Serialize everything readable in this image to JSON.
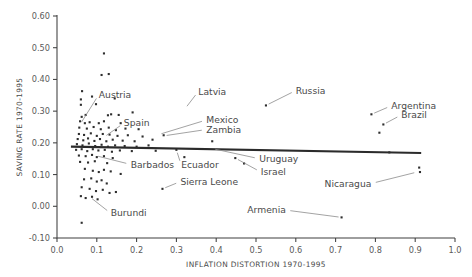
{
  "chart_data": {
    "type": "scatter",
    "title": "",
    "subtitle": "",
    "xlabel": "INFLATION DISTORTION 1970-1995",
    "ylabel": "SAVING RATE 1970-1995",
    "xlim": [
      0.0,
      1.0
    ],
    "ylim": [
      -0.1,
      0.6
    ],
    "grid": false,
    "legend": null,
    "xticks": [
      "0.0",
      "0.1",
      "0.2",
      "0.3",
      "0.4",
      "0.5",
      "0.6",
      "0.7",
      "0.8",
      "0.9",
      "1.0"
    ],
    "xtick_values": [
      0.0,
      0.1,
      0.2,
      0.3,
      0.4,
      0.5,
      0.6,
      0.7,
      0.8,
      0.9,
      1.0
    ],
    "yticks": [
      "-0.10",
      "0.00",
      "0.10",
      "0.20",
      "0.30",
      "0.40",
      "0.50",
      "0.60"
    ],
    "ytick_values": [
      -0.1,
      0.0,
      0.1,
      0.2,
      0.3,
      0.4,
      0.5,
      0.6
    ],
    "trend_line": {
      "x_start": 0.035,
      "y_start": 0.188,
      "x_end": 0.915,
      "y_end": 0.168
    },
    "points": [
      {
        "x": 0.118,
        "y": 0.482
      },
      {
        "x": 0.112,
        "y": 0.414
      },
      {
        "x": 0.13,
        "y": 0.417
      },
      {
        "x": 0.063,
        "y": 0.363
      },
      {
        "x": 0.088,
        "y": 0.346
      },
      {
        "x": 0.06,
        "y": 0.337
      },
      {
        "x": 0.145,
        "y": 0.34
      },
      {
        "x": 0.06,
        "y": 0.32
      },
      {
        "x": 0.098,
        "y": 0.322
      },
      {
        "x": 0.525,
        "y": 0.318
      },
      {
        "x": 0.79,
        "y": 0.29
      },
      {
        "x": 0.19,
        "y": 0.296
      },
      {
        "x": 0.062,
        "y": 0.282
      },
      {
        "x": 0.072,
        "y": 0.288
      },
      {
        "x": 0.128,
        "y": 0.287
      },
      {
        "x": 0.136,
        "y": 0.29
      },
      {
        "x": 0.155,
        "y": 0.288
      },
      {
        "x": 0.058,
        "y": 0.268
      },
      {
        "x": 0.07,
        "y": 0.262
      },
      {
        "x": 0.082,
        "y": 0.265
      },
      {
        "x": 0.105,
        "y": 0.262
      },
      {
        "x": 0.118,
        "y": 0.268
      },
      {
        "x": 0.16,
        "y": 0.262
      },
      {
        "x": 0.82,
        "y": 0.258
      },
      {
        "x": 0.056,
        "y": 0.248
      },
      {
        "x": 0.075,
        "y": 0.245
      },
      {
        "x": 0.092,
        "y": 0.25
      },
      {
        "x": 0.11,
        "y": 0.243
      },
      {
        "x": 0.13,
        "y": 0.248
      },
      {
        "x": 0.148,
        "y": 0.24
      },
      {
        "x": 0.172,
        "y": 0.245
      },
      {
        "x": 0.205,
        "y": 0.243
      },
      {
        "x": 0.81,
        "y": 0.232
      },
      {
        "x": 0.055,
        "y": 0.228
      },
      {
        "x": 0.068,
        "y": 0.225
      },
      {
        "x": 0.085,
        "y": 0.23
      },
      {
        "x": 0.1,
        "y": 0.222
      },
      {
        "x": 0.115,
        "y": 0.228
      },
      {
        "x": 0.132,
        "y": 0.226
      },
      {
        "x": 0.152,
        "y": 0.222
      },
      {
        "x": 0.178,
        "y": 0.224
      },
      {
        "x": 0.215,
        "y": 0.22
      },
      {
        "x": 0.268,
        "y": 0.224
      },
      {
        "x": 0.052,
        "y": 0.212
      },
      {
        "x": 0.066,
        "y": 0.208
      },
      {
        "x": 0.078,
        "y": 0.214
      },
      {
        "x": 0.094,
        "y": 0.206
      },
      {
        "x": 0.108,
        "y": 0.212
      },
      {
        "x": 0.124,
        "y": 0.205
      },
      {
        "x": 0.14,
        "y": 0.21
      },
      {
        "x": 0.165,
        "y": 0.207
      },
      {
        "x": 0.195,
        "y": 0.205
      },
      {
        "x": 0.24,
        "y": 0.21
      },
      {
        "x": 0.39,
        "y": 0.205
      },
      {
        "x": 0.05,
        "y": 0.196
      },
      {
        "x": 0.064,
        "y": 0.192
      },
      {
        "x": 0.08,
        "y": 0.198
      },
      {
        "x": 0.096,
        "y": 0.19
      },
      {
        "x": 0.112,
        "y": 0.194
      },
      {
        "x": 0.128,
        "y": 0.188
      },
      {
        "x": 0.146,
        "y": 0.192
      },
      {
        "x": 0.17,
        "y": 0.19
      },
      {
        "x": 0.2,
        "y": 0.188
      },
      {
        "x": 0.23,
        "y": 0.192
      },
      {
        "x": 0.048,
        "y": 0.178
      },
      {
        "x": 0.062,
        "y": 0.18
      },
      {
        "x": 0.076,
        "y": 0.174
      },
      {
        "x": 0.09,
        "y": 0.18
      },
      {
        "x": 0.104,
        "y": 0.176
      },
      {
        "x": 0.12,
        "y": 0.178
      },
      {
        "x": 0.138,
        "y": 0.172
      },
      {
        "x": 0.158,
        "y": 0.176
      },
      {
        "x": 0.188,
        "y": 0.174
      },
      {
        "x": 0.248,
        "y": 0.175
      },
      {
        "x": 0.3,
        "y": 0.178
      },
      {
        "x": 0.835,
        "y": 0.17
      },
      {
        "x": 0.055,
        "y": 0.16
      },
      {
        "x": 0.072,
        "y": 0.158
      },
      {
        "x": 0.088,
        "y": 0.162
      },
      {
        "x": 0.1,
        "y": 0.155
      },
      {
        "x": 0.118,
        "y": 0.158
      },
      {
        "x": 0.14,
        "y": 0.152
      },
      {
        "x": 0.32,
        "y": 0.155
      },
      {
        "x": 0.448,
        "y": 0.152
      },
      {
        "x": 0.058,
        "y": 0.14
      },
      {
        "x": 0.078,
        "y": 0.138
      },
      {
        "x": 0.095,
        "y": 0.142
      },
      {
        "x": 0.126,
        "y": 0.136
      },
      {
        "x": 0.47,
        "y": 0.135
      },
      {
        "x": 0.07,
        "y": 0.118
      },
      {
        "x": 0.09,
        "y": 0.112
      },
      {
        "x": 0.105,
        "y": 0.108
      },
      {
        "x": 0.118,
        "y": 0.115
      },
      {
        "x": 0.135,
        "y": 0.11
      },
      {
        "x": 0.16,
        "y": 0.102
      },
      {
        "x": 0.91,
        "y": 0.122
      },
      {
        "x": 0.912,
        "y": 0.108
      },
      {
        "x": 0.068,
        "y": 0.085
      },
      {
        "x": 0.086,
        "y": 0.088
      },
      {
        "x": 0.1,
        "y": 0.078
      },
      {
        "x": 0.112,
        "y": 0.082
      },
      {
        "x": 0.125,
        "y": 0.072
      },
      {
        "x": 0.062,
        "y": 0.06
      },
      {
        "x": 0.082,
        "y": 0.055
      },
      {
        "x": 0.098,
        "y": 0.048
      },
      {
        "x": 0.115,
        "y": 0.052
      },
      {
        "x": 0.132,
        "y": 0.042
      },
      {
        "x": 0.148,
        "y": 0.045
      },
      {
        "x": 0.265,
        "y": 0.055
      },
      {
        "x": 0.06,
        "y": 0.032
      },
      {
        "x": 0.072,
        "y": 0.026
      },
      {
        "x": 0.088,
        "y": 0.03
      },
      {
        "x": 0.102,
        "y": 0.022
      },
      {
        "x": 0.062,
        "y": -0.052
      },
      {
        "x": 0.715,
        "y": -0.035
      }
    ],
    "annotations": [
      {
        "label": "Austria",
        "label_x": 0.105,
        "label_y": 0.352,
        "point_x": 0.058,
        "point_y": 0.258
      },
      {
        "label": "Latvia",
        "label_x": 0.355,
        "label_y": 0.362,
        "point_x": 0.322,
        "point_y": 0.308
      },
      {
        "label": "Russia",
        "label_x": 0.6,
        "label_y": 0.365,
        "point_x": 0.525,
        "point_y": 0.318
      },
      {
        "label": "Argentina",
        "label_x": 0.84,
        "label_y": 0.317,
        "point_x": 0.79,
        "point_y": 0.29
      },
      {
        "label": "Brazil",
        "label_x": 0.865,
        "label_y": 0.288,
        "point_x": 0.82,
        "point_y": 0.258
      },
      {
        "label": "Spain",
        "label_x": 0.168,
        "label_y": 0.262,
        "point_x": 0.118,
        "point_y": 0.218
      },
      {
        "label": "Mexico",
        "label_x": 0.375,
        "label_y": 0.272,
        "point_x": 0.255,
        "point_y": 0.226
      },
      {
        "label": "Zambia",
        "label_x": 0.375,
        "label_y": 0.242,
        "point_x": 0.268,
        "point_y": 0.222
      },
      {
        "label": "Uruguay",
        "label_x": 0.508,
        "label_y": 0.15,
        "point_x": 0.39,
        "point_y": 0.182
      },
      {
        "label": "Barbados",
        "label_x": 0.185,
        "label_y": 0.132,
        "point_x": 0.096,
        "point_y": 0.16
      },
      {
        "label": "Ecuador",
        "label_x": 0.312,
        "label_y": 0.13,
        "point_x": 0.3,
        "point_y": 0.178
      },
      {
        "label": "Israel",
        "label_x": 0.512,
        "label_y": 0.108,
        "point_x": 0.448,
        "point_y": 0.152
      },
      {
        "label": "Sierra Leone",
        "label_x": 0.31,
        "label_y": 0.078,
        "point_x": 0.265,
        "point_y": 0.055
      },
      {
        "label": "Nicaragua",
        "label_x": 0.79,
        "label_y": 0.072,
        "point_x": 0.905,
        "point_y": 0.108
      },
      {
        "label": "Armenia",
        "label_x": 0.575,
        "label_y": -0.012,
        "point_x": 0.715,
        "point_y": -0.035
      },
      {
        "label": "Burundi",
        "label_x": 0.135,
        "label_y": -0.022,
        "point_x": 0.082,
        "point_y": 0.03
      }
    ]
  }
}
